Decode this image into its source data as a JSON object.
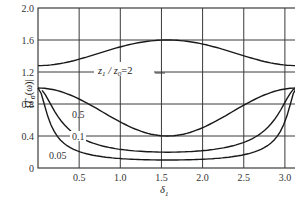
{
  "chart_data": {
    "type": "line",
    "title": "",
    "xlabel": "δ1",
    "ylabel": "|Tσ(ω)|",
    "xlim": [
      0,
      3.1416
    ],
    "ylim": [
      0,
      2.0
    ],
    "x_ticks": [
      "0.5",
      "1.0",
      "1.5",
      "2.0",
      "2.5",
      "3.0"
    ],
    "x_tick_values": [
      0.5,
      1.0,
      1.5,
      2.0,
      2.5,
      3.0
    ],
    "y_ticks": [
      "0",
      "0.4",
      "0.8",
      "1.2",
      "1.6",
      "2.0"
    ],
    "y_tick_values": [
      0,
      0.4,
      0.8,
      1.2,
      1.6,
      2.0
    ],
    "grid": true,
    "series": [
      {
        "name": "z1 / z0 = 2",
        "ratio": 2,
        "x": [
          0,
          0.5,
          1.0,
          1.5708,
          2.0,
          2.5,
          3.1416
        ],
        "values": [
          1.0,
          1.15,
          1.45,
          1.6,
          1.5,
          1.2,
          1.0
        ]
      },
      {
        "name": "0.5",
        "ratio": 0.5,
        "x": [
          0,
          0.5,
          1.0,
          1.5708,
          2.0,
          2.5,
          3.1416
        ],
        "values": [
          1.0,
          0.87,
          0.55,
          0.4,
          0.5,
          0.8,
          1.0
        ]
      },
      {
        "name": "0.1",
        "ratio": 0.1,
        "x": [
          0.05,
          0.5,
          1.0,
          1.5708,
          2.0,
          2.5,
          3.1416
        ],
        "values": [
          0.92,
          0.45,
          0.2,
          0.12,
          0.18,
          0.4,
          1.0
        ]
      },
      {
        "name": "0.05",
        "ratio": 0.05,
        "x": [
          0,
          0.5,
          1.0,
          1.5708,
          2.0,
          2.5,
          3.1416
        ],
        "values": [
          0.85,
          0.2,
          0.08,
          0.05,
          0.08,
          0.22,
          1.0
        ]
      }
    ],
    "annotations": [
      "z1 / z0 = 2",
      "0.5",
      "0.1",
      "0.05"
    ]
  },
  "labels": {
    "ylabel_main": "|T",
    "ylabel_sub": "σ",
    "ylabel_tail": "(ω)|",
    "xlabel_main": "δ",
    "xlabel_sub": "1",
    "ann_z": "z",
    "ann_sub1": "1",
    "ann_slash": " / ",
    "ann_sub0": "0",
    "ann_eq": "=2",
    "ann_05": "0.5",
    "ann_01": "0.1",
    "ann_005": "0.05"
  }
}
